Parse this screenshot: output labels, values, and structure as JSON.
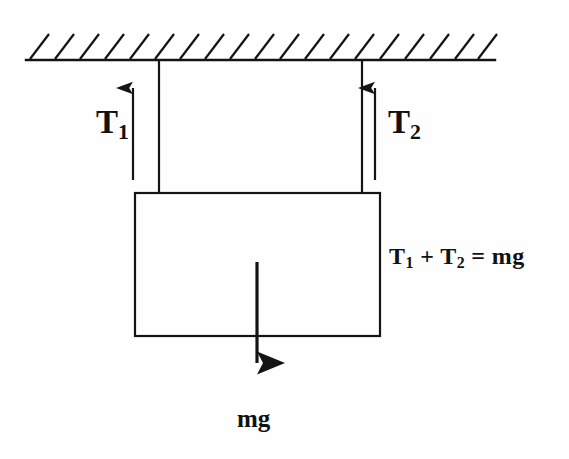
{
  "figure": {
    "background_color": "#fefefe",
    "stroke_color": "#141414",
    "labels": {
      "tension_left": "T",
      "tension_left_sub": "1",
      "tension_right": "T",
      "tension_right_sub": "2",
      "weight": "mg",
      "equation": "T₁ + T₂ = mg",
      "equation_parts": {
        "t1": "T",
        "t1_sub": "1",
        "plus": " + ",
        "t2": "T",
        "t2_sub": "2",
        "equals": " = ",
        "mg": "mg"
      }
    },
    "geometry": {
      "ceiling": {
        "x1": 26,
        "y": 60,
        "x2": 495,
        "hatch_count": 19,
        "hatch_spacing": 25,
        "hatch_length": 27,
        "hatch_angle_deg": 55
      },
      "string_left": {
        "x": 159,
        "y_top": 60,
        "y_bottom": 194
      },
      "string_right": {
        "x": 362,
        "y_top": 60,
        "y_bottom": 194
      },
      "block": {
        "x": 135,
        "y": 193,
        "width": 245,
        "height": 143
      },
      "arrow_t1": {
        "x": 133,
        "y_tail": 180,
        "y_head": 71
      },
      "arrow_t2": {
        "x": 375,
        "y_tail": 180,
        "y_head": 71
      },
      "arrow_mg": {
        "x": 257,
        "y_tail": 262,
        "y_head": 391
      }
    }
  }
}
